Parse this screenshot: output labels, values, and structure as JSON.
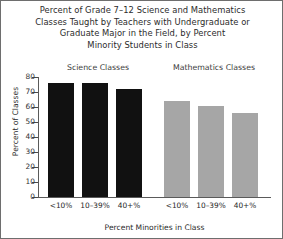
{
  "chart_data": {
    "type": "bar",
    "title": "Percent of Grade 7–12 Science and Mathematics Classes Taught by Teachers with Undergraduate or Graduate Major in the Field, by Percent Minority Students in Class",
    "title_lines": [
      "Percent of Grade 7–12 Science and Mathematics",
      "Classes Taught by Teachers with Undergraduate or",
      "Graduate Major in the Field, by Percent",
      "Minority Students in Class"
    ],
    "xlabel": "Percent Minorities in Class",
    "ylabel": "Percent of Classes",
    "ylim": [
      0,
      80
    ],
    "yticks": [
      0,
      10,
      20,
      30,
      40,
      50,
      60,
      70,
      80
    ],
    "ytick_labels": [
      "0",
      "10",
      "20",
      "30",
      "40",
      "50",
      "60",
      "70",
      "80"
    ],
    "grid": false,
    "legend": "none",
    "categories": [
      "<10%",
      "10–39%",
      "40+%"
    ],
    "groups": [
      {
        "name": "Science Classes",
        "color": "#111111",
        "values": [
          76,
          76,
          72
        ]
      },
      {
        "name": "Mathematics Classes",
        "color": "#a6a6a6",
        "values": [
          64,
          61,
          56
        ]
      }
    ],
    "colors": {
      "science_bar": "#111111",
      "math_bar": "#a6a6a6",
      "axis": "#5a5a5a",
      "text": "#2b2b2b",
      "background": "#ffffff",
      "frame": "#6e6e6e"
    }
  }
}
